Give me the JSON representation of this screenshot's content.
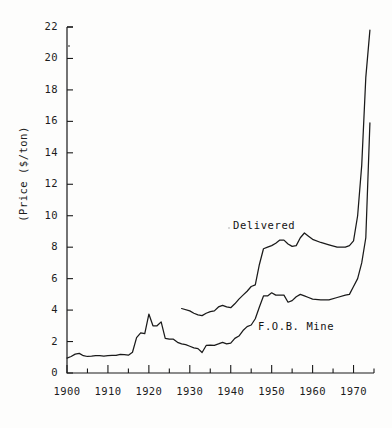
{
  "chart_data": {
    "type": "line",
    "title": "",
    "subtitle": "",
    "xlabel": "",
    "ylabel": "(Price ($/ton)",
    "xlim": [
      1900,
      1975
    ],
    "ylim": [
      0,
      22
    ],
    "grid": false,
    "legend_position": "inline-annotations",
    "y_ticks": [
      0,
      2,
      4,
      6,
      8,
      10,
      12,
      14,
      16,
      18,
      20,
      22
    ],
    "y_tick_labels": [
      "0",
      "2",
      "4",
      "6",
      "8",
      "10",
      "12",
      "14",
      "16",
      "18",
      "20",
      "22"
    ],
    "x_ticks": [
      1900,
      1910,
      1920,
      1930,
      1940,
      1950,
      1960,
      1970
    ],
    "x_tick_labels": [
      "1900",
      "1910",
      "1920",
      "1930",
      "1940",
      "1950",
      "1960",
      "1970"
    ],
    "x_minor_ticks": [
      1905,
      1915,
      1925,
      1935,
      1945,
      1955,
      1965,
      1975
    ],
    "series": [
      {
        "name": "Delivered",
        "label_x": 1953,
        "label_y": 9.6,
        "x": [
          1928,
          1930,
          1931,
          1932,
          1933,
          1934,
          1935,
          1936,
          1937,
          1938,
          1939,
          1940,
          1941,
          1942,
          1943,
          1944,
          1945,
          1946,
          1947,
          1948,
          1949,
          1950,
          1951,
          1952,
          1953,
          1954,
          1955,
          1956,
          1957,
          1958,
          1959,
          1960,
          1962,
          1964,
          1966,
          1968,
          1969,
          1970,
          1971,
          1972,
          1973,
          1974
        ],
        "y": [
          4.1,
          3.95,
          3.8,
          3.7,
          3.65,
          3.8,
          3.9,
          3.95,
          4.2,
          4.3,
          4.2,
          4.15,
          4.4,
          4.7,
          4.95,
          5.2,
          5.5,
          5.6,
          6.9,
          7.9,
          8.0,
          8.1,
          8.25,
          8.45,
          8.45,
          8.2,
          8.05,
          8.1,
          8.6,
          8.9,
          8.7,
          8.5,
          8.3,
          8.15,
          8.0,
          8.0,
          8.1,
          8.4,
          10.0,
          13.2,
          18.8,
          21.8
        ]
      },
      {
        "name": "F.O.B. Mine",
        "label_x": 1956,
        "label_y": 3.5,
        "x": [
          1900,
          1901,
          1902,
          1903,
          1904,
          1905,
          1906,
          1907,
          1908,
          1909,
          1910,
          1911,
          1912,
          1913,
          1914,
          1915,
          1916,
          1917,
          1918,
          1919,
          1920,
          1921,
          1922,
          1923,
          1924,
          1925,
          1926,
          1927,
          1928,
          1929,
          1930,
          1931,
          1932,
          1933,
          1934,
          1935,
          1936,
          1937,
          1938,
          1939,
          1940,
          1941,
          1942,
          1943,
          1944,
          1945,
          1946,
          1947,
          1948,
          1949,
          1950,
          1951,
          1952,
          1953,
          1954,
          1955,
          1956,
          1957,
          1958,
          1959,
          1960,
          1962,
          1964,
          1966,
          1968,
          1969,
          1970,
          1971,
          1972,
          1973,
          1974
        ],
        "y": [
          0.95,
          1.05,
          1.2,
          1.25,
          1.1,
          1.05,
          1.07,
          1.1,
          1.1,
          1.07,
          1.1,
          1.12,
          1.12,
          1.18,
          1.17,
          1.13,
          1.32,
          2.25,
          2.55,
          2.5,
          3.75,
          3.0,
          3.0,
          3.25,
          2.2,
          2.15,
          2.15,
          1.95,
          1.85,
          1.8,
          1.7,
          1.6,
          1.55,
          1.3,
          1.75,
          1.77,
          1.76,
          1.85,
          1.95,
          1.85,
          1.9,
          2.2,
          2.35,
          2.7,
          2.95,
          3.05,
          3.45,
          4.2,
          4.9,
          4.9,
          5.1,
          4.95,
          4.95,
          4.95,
          4.5,
          4.6,
          4.85,
          5.0,
          4.9,
          4.8,
          4.7,
          4.65,
          4.65,
          4.8,
          4.95,
          5.0,
          5.5,
          6.0,
          7.0,
          8.6,
          15.9
        ]
      }
    ]
  },
  "axis": {
    "y_title": "(Price ($/ton)"
  },
  "annotations": {
    "delivered": "Delivered",
    "fob_mine": "F.O.B. Mine"
  }
}
